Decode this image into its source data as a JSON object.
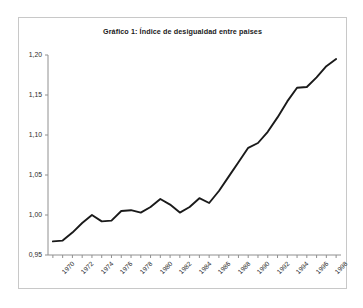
{
  "figure": {
    "title": "Gráfico 1: Índice de desigualdad entre paises",
    "background": "#ffffff",
    "border_color": "#c8c8c8",
    "line_color": "#1a1a1a",
    "axis_color": "#808080"
  },
  "chart_data": {
    "type": "line",
    "title": "Gráfico 1: Índice de desigualdad entre paises",
    "xlabel": "",
    "ylabel": "",
    "xlim": [
      1969.5,
      1999.5
    ],
    "ylim": [
      0.95,
      1.2
    ],
    "grid": false,
    "legend": null,
    "y_ticks": [
      0.95,
      1.0,
      1.05,
      1.1,
      1.15,
      1.2
    ],
    "y_tick_labels": [
      "0,95",
      "1,00",
      "1,05",
      "1,10",
      "1,15",
      "1,20"
    ],
    "x_ticks": [
      1970,
      1972,
      1974,
      1976,
      1978,
      1980,
      1982,
      1984,
      1986,
      1988,
      1990,
      1992,
      1994,
      1996,
      1998
    ],
    "x_tick_labels": [
      "1970",
      "1972",
      "1974",
      "1976",
      "1978",
      "1980",
      "1982",
      "1984",
      "1986",
      "1988",
      "1990",
      "1992",
      "1994",
      "1996",
      "1998"
    ],
    "x_minor_step": 1,
    "series": [
      {
        "name": "Índice de desigualdad entre paises",
        "color": "#1a1a1a",
        "x": [
          1970,
          1971,
          1972,
          1973,
          1974,
          1975,
          1976,
          1977,
          1978,
          1979,
          1980,
          1981,
          1982,
          1983,
          1984,
          1985,
          1986,
          1987,
          1988,
          1989,
          1990,
          1991,
          1992,
          1993,
          1994,
          1995,
          1996,
          1997,
          1998,
          1999
        ],
        "values": [
          0.967,
          0.968,
          0.978,
          0.99,
          1.0,
          0.992,
          0.993,
          1.005,
          1.006,
          1.003,
          1.01,
          1.02,
          1.013,
          1.003,
          1.01,
          1.021,
          1.015,
          1.03,
          1.048,
          1.066,
          1.084,
          1.09,
          1.104,
          1.122,
          1.142,
          1.159,
          1.16,
          1.172,
          1.186,
          1.195
        ]
      }
    ]
  }
}
